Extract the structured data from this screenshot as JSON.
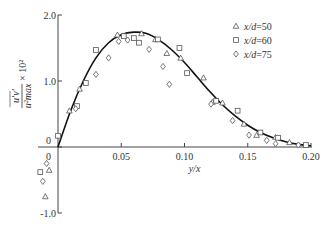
{
  "chart_data": {
    "type": "scatter",
    "title": "",
    "xlabel": "y/x",
    "ylabel": "u'v' / u_max^2 × 10^2",
    "ylabel_parts": {
      "num": "u′v′",
      "den": "u²max",
      "mult": "× 10²"
    },
    "xlim": [
      0,
      0.2
    ],
    "ylim": [
      -1.0,
      2.0
    ],
    "x_ticks": [
      "0",
      "0.05",
      "0.10",
      "0.15",
      "0.20"
    ],
    "x_tick_values": [
      0,
      0.05,
      0.1,
      0.15,
      0.2
    ],
    "y_ticks": [
      "2.0",
      "1.0",
      "0",
      "-1.0"
    ],
    "y_tick_values": [
      2.0,
      1.0,
      0,
      -1.0
    ],
    "grid": false,
    "legend_position": "upper right",
    "series": [
      {
        "name": "x/d=50",
        "label_var": "x/d",
        "label_val": "=50",
        "marker": "triangle",
        "points": [
          [
            -0.007,
            -0.35
          ],
          [
            -0.01,
            -0.75
          ],
          [
            0.009,
            0.55
          ],
          [
            0.017,
            0.88
          ],
          [
            0.047,
            1.7
          ],
          [
            0.066,
            1.72
          ],
          [
            0.077,
            1.63
          ],
          [
            0.086,
            1.42
          ],
          [
            0.097,
            1.35
          ],
          [
            0.115,
            1.05
          ],
          [
            0.122,
            0.68
          ],
          [
            0.13,
            0.67
          ],
          [
            0.147,
            0.35
          ],
          [
            0.157,
            0.18
          ],
          [
            0.172,
            0.15
          ],
          [
            0.183,
            0.07
          ]
        ]
      },
      {
        "name": "x/d=60",
        "label_var": "x/d",
        "label_val": "=60",
        "marker": "square",
        "points": [
          [
            0.0,
            0.17
          ],
          [
            -0.014,
            -0.38
          ],
          [
            0.015,
            0.62
          ],
          [
            0.022,
            0.97
          ],
          [
            0.03,
            1.47
          ],
          [
            0.052,
            1.68
          ],
          [
            0.06,
            1.65
          ],
          [
            0.064,
            1.58
          ],
          [
            0.079,
            1.63
          ],
          [
            0.096,
            1.5
          ],
          [
            0.102,
            1.12
          ],
          [
            0.125,
            0.7
          ],
          [
            0.142,
            0.55
          ],
          [
            0.16,
            0.22
          ],
          [
            0.174,
            0.14
          ],
          [
            0.196,
            0.03
          ]
        ]
      },
      {
        "name": "x/d=75",
        "label_var": "x/d",
        "label_val": "=75",
        "marker": "diamond",
        "points": [
          [
            -0.009,
            -0.25
          ],
          [
            -0.012,
            -0.52
          ],
          [
            0.014,
            0.58
          ],
          [
            0.03,
            1.1
          ],
          [
            0.04,
            1.35
          ],
          [
            0.048,
            1.6
          ],
          [
            0.055,
            1.62
          ],
          [
            0.072,
            1.48
          ],
          [
            0.083,
            1.22
          ],
          [
            0.088,
            0.95
          ],
          [
            0.121,
            0.65
          ],
          [
            0.138,
            0.4
          ],
          [
            0.151,
            0.18
          ],
          [
            0.165,
            0.1
          ],
          [
            0.172,
            0.05
          ],
          [
            0.19,
            0.03
          ]
        ]
      }
    ],
    "fit_curve": {
      "name": "theory",
      "x": [
        0,
        0.01,
        0.02,
        0.03,
        0.04,
        0.05,
        0.06,
        0.07,
        0.08,
        0.09,
        0.1,
        0.11,
        0.12,
        0.13,
        0.14,
        0.15,
        0.16,
        0.17,
        0.18,
        0.19,
        0.2
      ],
      "y": [
        0,
        0.55,
        1.0,
        1.35,
        1.58,
        1.7,
        1.74,
        1.72,
        1.62,
        1.47,
        1.28,
        1.06,
        0.84,
        0.64,
        0.47,
        0.33,
        0.22,
        0.14,
        0.08,
        0.04,
        0.02
      ]
    }
  }
}
